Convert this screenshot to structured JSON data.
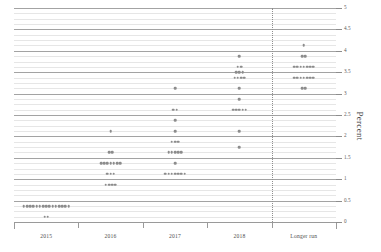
{
  "chart_data": {
    "type": "scatter",
    "title": "",
    "subtitle": "",
    "xlabel": "",
    "ylabel": "Percent",
    "ylim": [
      0,
      5
    ],
    "yticks": [
      0,
      0.5,
      1,
      1.5,
      2,
      2.5,
      3,
      3.5,
      4,
      4.5,
      5
    ],
    "ytick_labels": [
      "0",
      "0.5",
      "1",
      "1.5",
      "2",
      "2.5",
      "3",
      "3.5",
      "4",
      "4.5",
      "5"
    ],
    "grid": true,
    "grid_minor_step": 0.125,
    "grid_major_step": 0.5,
    "legend": "none",
    "categories": [
      "2015",
      "2016",
      "2017",
      "2018",
      "Longer run"
    ],
    "separator_after_category": "2018",
    "series": [
      {
        "name": "2015",
        "category": "2015",
        "points": [
          {
            "value": 0.375,
            "count": 15
          },
          {
            "value": 0.125,
            "count": 2
          }
        ]
      },
      {
        "name": "2016",
        "category": "2016",
        "points": [
          {
            "value": 2.125,
            "count": 1
          },
          {
            "value": 1.625,
            "count": 2
          },
          {
            "value": 1.375,
            "count": 7
          },
          {
            "value": 1.125,
            "count": 3
          },
          {
            "value": 0.875,
            "count": 4
          }
        ]
      },
      {
        "name": "2017",
        "category": "2017",
        "points": [
          {
            "value": 3.125,
            "count": 1
          },
          {
            "value": 2.625,
            "count": 2
          },
          {
            "value": 2.375,
            "count": 1
          },
          {
            "value": 2.125,
            "count": 1
          },
          {
            "value": 1.875,
            "count": 3
          },
          {
            "value": 1.625,
            "count": 5
          },
          {
            "value": 1.375,
            "count": 1
          },
          {
            "value": 1.125,
            "count": 7
          }
        ]
      },
      {
        "name": "2018",
        "category": "2018",
        "points": [
          {
            "value": 3.875,
            "count": 1
          },
          {
            "value": 3.625,
            "count": 2
          },
          {
            "value": 3.5,
            "count": 3
          },
          {
            "value": 3.375,
            "count": 4
          },
          {
            "value": 3.125,
            "count": 1
          },
          {
            "value": 2.875,
            "count": 1
          },
          {
            "value": 2.625,
            "count": 5
          },
          {
            "value": 2.125,
            "count": 1
          },
          {
            "value": 1.75,
            "count": 1
          }
        ]
      },
      {
        "name": "Longer run",
        "category": "Longer run",
        "points": [
          {
            "value": 4.125,
            "count": 1
          },
          {
            "value": 3.875,
            "count": 2
          },
          {
            "value": 3.625,
            "count": 7
          },
          {
            "value": 3.375,
            "count": 7
          },
          {
            "value": 3.125,
            "count": 2
          }
        ]
      }
    ]
  },
  "axes": {
    "y_title": "Percent",
    "y_tick_labels": [
      "0",
      "0.5",
      "1",
      "1.5",
      "2",
      "2.5",
      "3",
      "3.5",
      "4",
      "4.5",
      "5"
    ],
    "x_tick_labels": [
      "2015",
      "2016",
      "2017",
      "2018",
      "Longer run"
    ]
  }
}
